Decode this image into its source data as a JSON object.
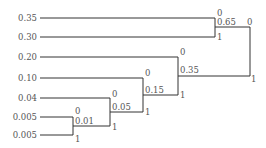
{
  "diagram": {
    "type": "huffman-tree",
    "leaves": [
      {
        "label": "0.35",
        "y": 18
      },
      {
        "label": "0.30",
        "y": 37
      },
      {
        "label": "0.20",
        "y": 57
      },
      {
        "label": "0.10",
        "y": 78
      },
      {
        "label": "0.04",
        "y": 98
      },
      {
        "label": "0.005",
        "y": 117
      },
      {
        "label": "0.005",
        "y": 135
      }
    ],
    "nodes": [
      {
        "id": "n1",
        "sum": "0.01",
        "top_bit": "0",
        "bottom_bit": "1"
      },
      {
        "id": "n2",
        "sum": "0.05",
        "top_bit": "0",
        "bottom_bit": "1"
      },
      {
        "id": "n3",
        "sum": "0.15",
        "top_bit": "0",
        "bottom_bit": "1"
      },
      {
        "id": "n4",
        "sum": "0.35",
        "top_bit": "0",
        "bottom_bit": "1"
      },
      {
        "id": "n5",
        "sum": "0.65",
        "top_bit": "0",
        "bottom_bit": "1"
      },
      {
        "id": "root",
        "sum": "",
        "top_bit": "0",
        "bottom_bit": "1"
      }
    ]
  }
}
